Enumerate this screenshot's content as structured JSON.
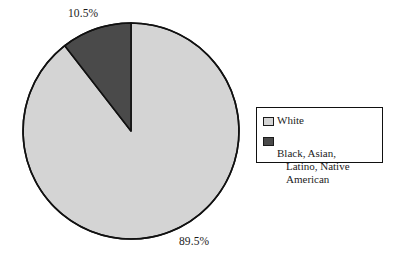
{
  "chart_data": {
    "type": "pie",
    "title": "",
    "subtitle": "",
    "xlabel": "",
    "ylabel": "",
    "legend_position": "right",
    "grid": false,
    "categories": [
      "White",
      "Black, Asian, Latino, Native American"
    ],
    "values": [
      89.5,
      10.5
    ],
    "slices": [
      {
        "label": "White",
        "value": 89.5,
        "data_label": "89.5%",
        "color": "#d4d4d4"
      },
      {
        "label": "Black, Asian, Latino, Native American",
        "value": 10.5,
        "data_label": "10.5%",
        "color": "#4a4a4a"
      }
    ],
    "annotations": [
      "10.5%",
      "89.5%"
    ]
  },
  "labels": {
    "dark_slice_percent": "10.5%",
    "light_slice_percent": "89.5%"
  },
  "legend": {
    "entries": [
      {
        "swatch_name": "legend-swatch-white",
        "label": "White",
        "label_line1": "White",
        "label_line2": "",
        "color": "#d4d4d4"
      },
      {
        "swatch_name": "legend-swatch-minority",
        "label": "Black, Asian, Latino, Native American",
        "label_line1": "Black, Asian,",
        "label_line2": "Latino, Native American",
        "color": "#4a4a4a"
      }
    ]
  },
  "colors": {
    "light_slice": "#d4d4d4",
    "dark_slice": "#4a4a4a",
    "outline": "#111111",
    "background": "#ffffff",
    "text": "#1c1c1c"
  }
}
